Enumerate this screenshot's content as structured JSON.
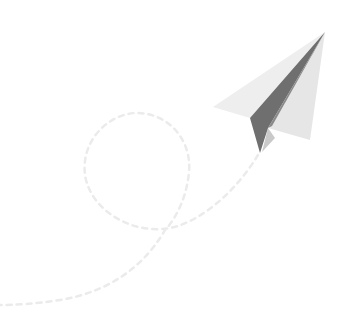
{
  "illustration": {
    "subject": "paper-airplane-with-dashed-flight-path",
    "alt": "Paper airplane flying with a looping dashed trail",
    "colors": {
      "background": "#ffffff",
      "wing_light": "#ececec",
      "wing_mid": "#e2e2e2",
      "fold_dark": "#707070",
      "fold_shadow": "#9a9a9a",
      "inner_flap": "#c8c8c8",
      "trail": "#ececec"
    }
  }
}
